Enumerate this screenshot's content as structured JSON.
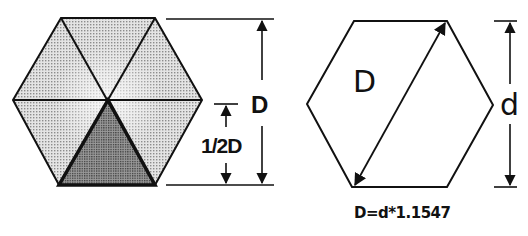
{
  "left_figure": {
    "label_D": "D",
    "label_half_D": "1/2D",
    "colors": {
      "light_fill": "#d6d6d6",
      "center_fill": "#ececec",
      "dark_fill": "#8a8a8a",
      "stroke": "#111111"
    }
  },
  "right_figure": {
    "label_D": "D",
    "label_d": "d",
    "formula": "D=d*1.1547"
  }
}
